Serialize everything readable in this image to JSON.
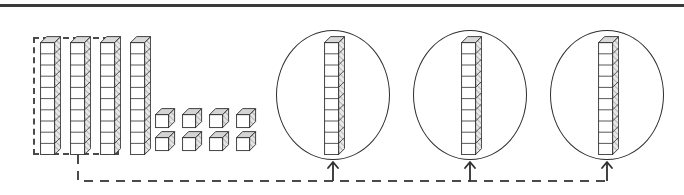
{
  "figure": {
    "background_color": "#ffffff",
    "ink_color": "#2e2e2e",
    "dash_color": "#4a4a4a",
    "top_rule_color": "#3a3a3a"
  },
  "source_set": {
    "label": "source blocks",
    "rods": [
      {
        "name": "rod-1",
        "x": 40,
        "y": 36,
        "segments": 10,
        "selected": true
      },
      {
        "name": "rod-2",
        "x": 70,
        "y": 36,
        "segments": 10,
        "selected": true
      },
      {
        "name": "rod-3",
        "x": 100,
        "y": 36,
        "segments": 10,
        "selected": true
      },
      {
        "name": "rod-4",
        "x": 130,
        "y": 36,
        "segments": 10,
        "selected": false
      }
    ],
    "rod_segment_count": 10,
    "rod_count": 4,
    "unit_cubes": [
      {
        "name": "unit-1",
        "x": 155,
        "y": 108
      },
      {
        "name": "unit-2",
        "x": 182,
        "y": 108
      },
      {
        "name": "unit-3",
        "x": 209,
        "y": 108
      },
      {
        "name": "unit-4",
        "x": 236,
        "y": 108
      },
      {
        "name": "unit-5",
        "x": 155,
        "y": 131
      },
      {
        "name": "unit-6",
        "x": 182,
        "y": 131
      },
      {
        "name": "unit-7",
        "x": 209,
        "y": 131
      },
      {
        "name": "unit-8",
        "x": 236,
        "y": 131
      }
    ],
    "unit_cube_count": 8,
    "unit_rows": 2,
    "unit_columns": 4,
    "total_value": 48
  },
  "selection_box": {
    "label": "dashed selection around three rods",
    "x": 33,
    "y": 37,
    "width": 86,
    "height": 118,
    "enclosed_rod_count": 3,
    "enclosed_value": 30
  },
  "groups": [
    {
      "name": "group-1",
      "circle": {
        "cx": 333,
        "cy": 95,
        "rx": 57,
        "ry": 65
      },
      "rod": {
        "x": 324,
        "y": 36,
        "segments": 10
      },
      "arrow_x": 333,
      "value": 10
    },
    {
      "name": "group-2",
      "circle": {
        "cx": 470,
        "cy": 95,
        "rx": 57,
        "ry": 65
      },
      "rod": {
        "x": 461,
        "y": 36,
        "segments": 10
      },
      "arrow_x": 470,
      "value": 10
    },
    {
      "name": "group-3",
      "circle": {
        "cx": 607,
        "cy": 95,
        "rx": 57,
        "ry": 65
      },
      "rod": {
        "x": 598,
        "y": 36,
        "segments": 10
      },
      "arrow_x": 607,
      "value": 10
    }
  ],
  "connector": {
    "label": "dashed distribution path with three up-arrows",
    "stub_x": 78,
    "stub_top_y": 155,
    "corner_x": 78,
    "rail_y": 181,
    "rail_start_x": 78,
    "rail_end_x": 607,
    "arrow_tip_y": 162,
    "arrow_count": 3,
    "dash_pattern": "9 7"
  }
}
